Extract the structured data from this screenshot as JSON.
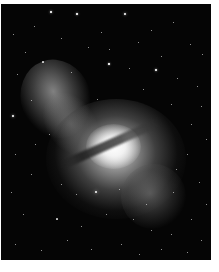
{
  "image": {
    "subject": "galaxy photograph (Centaurus A) on starfield",
    "palette": {
      "sky": "#050505",
      "core": "#ffffff",
      "nebula": "#aaaaaa",
      "frame": "#ffffff"
    },
    "stars": [
      [
        50,
        8,
        1.6
      ],
      [
        76,
        10,
        1.5
      ],
      [
        124,
        10,
        1.8
      ],
      [
        12,
        30,
        1
      ],
      [
        33,
        22,
        1
      ],
      [
        100,
        28,
        1
      ],
      [
        150,
        26,
        1
      ],
      [
        172,
        18,
        1
      ],
      [
        189,
        40,
        1
      ],
      [
        24,
        48,
        1
      ],
      [
        42,
        58,
        1.2
      ],
      [
        60,
        34,
        1
      ],
      [
        87,
        43,
        1
      ],
      [
        108,
        45,
        1
      ],
      [
        137,
        38,
        1
      ],
      [
        160,
        52,
        1
      ],
      [
        201,
        50,
        1
      ],
      [
        16,
        70,
        1
      ],
      [
        70,
        68,
        1
      ],
      [
        108,
        60,
        1.4
      ],
      [
        128,
        64,
        1
      ],
      [
        155,
        66,
        1.6
      ],
      [
        176,
        74,
        1
      ],
      [
        196,
        82,
        1
      ],
      [
        12,
        112,
        1.8
      ],
      [
        30,
        96,
        1
      ],
      [
        96,
        95,
        1
      ],
      [
        142,
        85,
        1
      ],
      [
        170,
        100,
        1
      ],
      [
        200,
        102,
        1
      ],
      [
        190,
        120,
        1
      ],
      [
        205,
        135,
        1
      ],
      [
        14,
        150,
        1
      ],
      [
        30,
        170,
        1
      ],
      [
        10,
        188,
        1
      ],
      [
        60,
        180,
        1
      ],
      [
        75,
        190,
        1
      ],
      [
        95,
        188,
        2.4
      ],
      [
        118,
        185,
        1
      ],
      [
        145,
        200,
        1
      ],
      [
        172,
        188,
        1
      ],
      [
        198,
        178,
        1
      ],
      [
        22,
        210,
        1
      ],
      [
        56,
        215,
        1.2
      ],
      [
        80,
        222,
        1
      ],
      [
        105,
        210,
        1
      ],
      [
        132,
        215,
        1
      ],
      [
        150,
        226,
        1
      ],
      [
        170,
        230,
        1
      ],
      [
        190,
        215,
        1
      ],
      [
        205,
        200,
        1
      ],
      [
        14,
        240,
        1
      ],
      [
        40,
        246,
        1
      ],
      [
        66,
        236,
        1
      ],
      [
        90,
        245,
        1
      ],
      [
        120,
        240,
        1
      ],
      [
        138,
        250,
        1
      ],
      [
        160,
        245,
        1
      ],
      [
        186,
        248,
        1
      ],
      [
        200,
        236,
        1
      ],
      [
        48,
        130,
        1
      ],
      [
        34,
        140,
        1
      ],
      [
        186,
        150,
        1
      ],
      [
        175,
        165,
        1
      ]
    ]
  }
}
